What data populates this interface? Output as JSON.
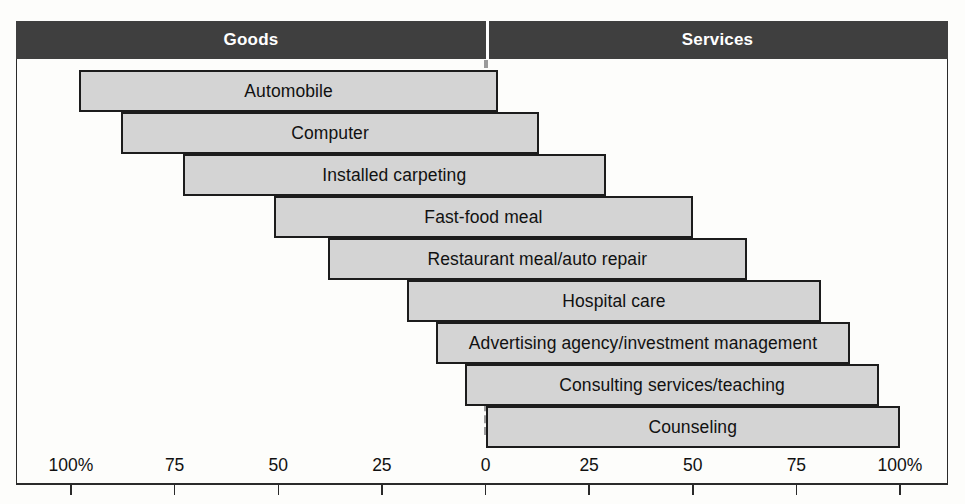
{
  "header": {
    "left_label": "Goods",
    "right_label": "Services",
    "band_color": "#3f3f3f",
    "text_color": "#ffffff"
  },
  "axis": {
    "left_ticks": [
      {
        "label": "100%",
        "value": 100
      },
      {
        "label": "75",
        "value": 75
      },
      {
        "label": "50",
        "value": 50
      },
      {
        "label": "25",
        "value": 25
      },
      {
        "label": "0",
        "value": 0
      }
    ],
    "right_ticks": [
      {
        "label": "0",
        "value": 0
      },
      {
        "label": "25",
        "value": 25
      },
      {
        "label": "50",
        "value": 50
      },
      {
        "label": "75",
        "value": 75
      },
      {
        "label": "100%",
        "value": 100
      }
    ]
  },
  "style": {
    "bar_fill": "#d4d4d4",
    "bar_stroke": "#1c1c1c",
    "center_line_color": "#9a9a9a",
    "frame_color": "#2a2a2a"
  },
  "chart_data": {
    "type": "bar",
    "title": "",
    "subtitle": "",
    "xlabel": "",
    "ylabel": "",
    "orientation": "horizontal",
    "variant": "diverging-stacked-continuum",
    "grid": false,
    "legend": null,
    "axis_left_label": "Goods",
    "axis_right_label": "Services",
    "xlim_left": [
      100,
      0
    ],
    "xlim_right": [
      0,
      100
    ],
    "series": [
      {
        "name": "Goods",
        "values": [
          98,
          88,
          73,
          51,
          38,
          19,
          12,
          5,
          0
        ]
      },
      {
        "name": "Services",
        "values": [
          3,
          13,
          29,
          50,
          63,
          81,
          88,
          95,
          100
        ]
      }
    ],
    "categories": [
      "Automobile",
      "Computer",
      "Installed carpeting",
      "Fast-food meal",
      "Restaurant meal/auto repair",
      "Hospital care",
      "Advertising agency/investment management",
      "Consulting services/teaching",
      "Counseling"
    ],
    "bars": [
      {
        "label": "Automobile",
        "goods_pct": 98,
        "services_pct": 3
      },
      {
        "label": "Computer",
        "goods_pct": 88,
        "services_pct": 13
      },
      {
        "label": "Installed carpeting",
        "goods_pct": 73,
        "services_pct": 29
      },
      {
        "label": "Fast-food meal",
        "goods_pct": 51,
        "services_pct": 50
      },
      {
        "label": "Restaurant meal/auto repair",
        "goods_pct": 38,
        "services_pct": 63
      },
      {
        "label": "Hospital care",
        "goods_pct": 19,
        "services_pct": 81
      },
      {
        "label": "Advertising agency/investment management",
        "goods_pct": 12,
        "services_pct": 88
      },
      {
        "label": "Consulting services/teaching",
        "goods_pct": 5,
        "services_pct": 95
      },
      {
        "label": "Counseling",
        "goods_pct": 0,
        "services_pct": 100
      }
    ]
  }
}
